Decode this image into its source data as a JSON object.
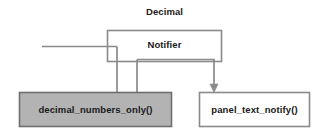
{
  "diagram": {
    "title": "Decimal",
    "type": "sequence-flow-diagram",
    "colors": {
      "background": "#ffffff",
      "stroke": "#808080",
      "dark_stroke": "#5a5a5a",
      "text": "#1a1a1a",
      "shaded_fill": "#b3b3b3",
      "plain_fill": "#ffffff"
    },
    "nodes": [
      {
        "id": "notifier",
        "label": "Notifier",
        "shape": "rectangle",
        "fill": "#ffffff",
        "x": 107,
        "y": 30,
        "width": 115,
        "height": 32
      },
      {
        "id": "decimal_numbers_only",
        "label": "decimal_numbers_only()",
        "shape": "rectangle",
        "fill": "#b3b3b3",
        "x": 19,
        "y": 92,
        "width": 153,
        "height": 35
      },
      {
        "id": "panel_text_notify",
        "label": "panel_text_notify()",
        "shape": "rectangle",
        "fill": "#ffffff",
        "x": 199,
        "y": 92,
        "width": 111,
        "height": 35
      }
    ],
    "connectors": [
      {
        "id": "incoming-line",
        "from": "left-edge",
        "to": "notifier",
        "arrowhead": false,
        "description": "horizontal line entering from the left into the Notifier region"
      },
      {
        "id": "notifier-to-decimal",
        "from": "notifier",
        "to": "decimal_numbers_only",
        "arrowhead": false,
        "description": "U-shaped routed line dropping down into the shaded decimal_numbers_only() box"
      },
      {
        "id": "notifier-to-panel",
        "from": "notifier",
        "to": "panel_text_notify",
        "arrowhead": true,
        "description": "line routed right then down with arrowhead into panel_text_notify()"
      }
    ]
  }
}
